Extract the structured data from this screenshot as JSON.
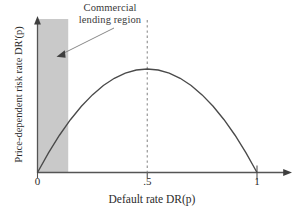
{
  "chart_data": {
    "type": "line",
    "title": "",
    "xlabel": "Default rate DR(p)",
    "ylabel": "Price-dependent risk rate DR'(p)",
    "xlim": [
      0,
      1.12
    ],
    "ylim": [
      0,
      1.15
    ],
    "grid": false,
    "legend": null,
    "x_ticks": [
      {
        "value": 0,
        "label": "0"
      },
      {
        "value": 0.5,
        "label": ".5"
      },
      {
        "value": 1,
        "label": "1"
      }
    ],
    "y_ticks": [],
    "series": [
      {
        "name": "Price-dependent risk rate curve",
        "shape": "inverted-parabola",
        "color": "#4a4a4a",
        "x": [
          0.0,
          0.05,
          0.1,
          0.15,
          0.2,
          0.25,
          0.3,
          0.35,
          0.4,
          0.45,
          0.5,
          0.55,
          0.6,
          0.65,
          0.7,
          0.75,
          0.8,
          0.85,
          0.9,
          0.95,
          1.0
        ],
        "values": [
          0.0,
          0.19,
          0.36,
          0.51,
          0.64,
          0.75,
          0.84,
          0.91,
          0.96,
          0.99,
          1.0,
          0.99,
          0.96,
          0.91,
          0.84,
          0.75,
          0.64,
          0.51,
          0.36,
          0.19,
          0.0
        ]
      }
    ],
    "peak": {
      "x": 0.5,
      "y": 1.0
    },
    "vertical_reference_line": {
      "x": 0.5,
      "style": "dashed",
      "color": "#8c8c8c"
    },
    "shaded_region": {
      "label": "Commercial lending region",
      "x_start": 0.0,
      "x_end": 0.14,
      "color": "#c9c9c9"
    },
    "annotation": {
      "line1": "Commercial",
      "line2": "lending region",
      "arrow_target": "shaded-region"
    }
  },
  "axes": {
    "x_title": "Default rate DR(p)",
    "y_title": "Price-dependent risk rate DR'(p)",
    "tick_0": "0",
    "tick_half": ".5",
    "tick_one": "1"
  },
  "colors": {
    "curve": "#4a4a4a",
    "axis": "#555555",
    "shade": "#c9c9c9",
    "dashed": "#8c8c8c",
    "background": "#ffffff"
  }
}
